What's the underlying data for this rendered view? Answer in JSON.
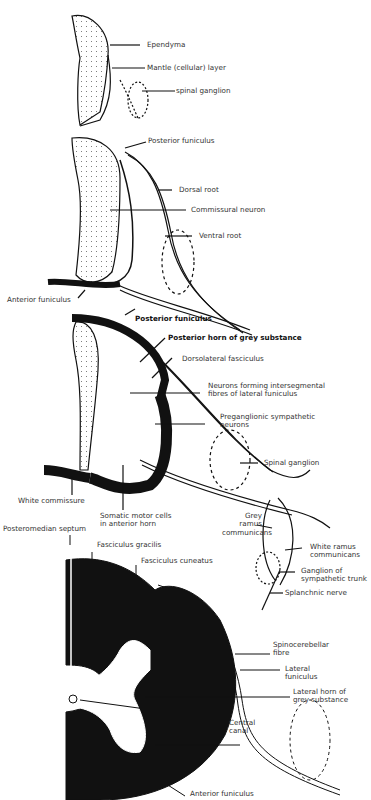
{
  "figure": {
    "panels": [
      {
        "id": "stage-1",
        "labels": [
          "Ependyma",
          "Mantle (cellular) layer",
          "spinal ganglion"
        ]
      },
      {
        "id": "stage-2",
        "labels": [
          "Posterior funiculus",
          "Dorsal root",
          "Commissural neuron",
          "Ventral root",
          "Anterior funiculus"
        ]
      },
      {
        "id": "stage-3",
        "labels": [
          "Posterior funiculus",
          "Posterior horn of grey substance",
          "Dorsolateral fasciculus",
          "Neurons forming intersegmental\nfibres of lateral funiculus",
          "Preganglionic sympathetic\nneurons",
          "Spinal ganglion",
          "White commissure",
          "Somatic motor cells\nin anterior horn",
          "Grey\nramus\ncommunicans",
          "White ramus\ncommunicans",
          "Ganglion of\nsympathetic trunk",
          "Splanchnic nerve"
        ]
      },
      {
        "id": "stage-4",
        "labels": [
          "Posteromedian septum",
          "Fasciculus gracilis",
          "Fasciculus cuneatus",
          "Spinocerebellar\nfibre",
          "Lateral\nfuniculus",
          "Lateral horn of\ngrey substance",
          "Central\ncanal",
          "Anterior funiculus"
        ]
      }
    ]
  }
}
